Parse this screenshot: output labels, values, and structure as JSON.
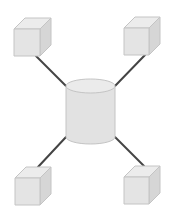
{
  "diagram": {
    "colors": {
      "background": "#ffffff",
      "line": "#444444",
      "shape_fill": "#e4e4e4",
      "shape_top": "#ececec",
      "shape_side": "#d6d6d6",
      "shape_stroke": "#c4c4c4"
    },
    "center": {
      "type": "cylinder",
      "label": "database"
    },
    "nodes": [
      {
        "id": "top-left",
        "type": "cube",
        "label": "node"
      },
      {
        "id": "top-right",
        "type": "cube",
        "label": "node"
      },
      {
        "id": "bottom-left",
        "type": "cube",
        "label": "node"
      },
      {
        "id": "bottom-right",
        "type": "cube",
        "label": "node"
      }
    ],
    "edges": [
      {
        "from": "database",
        "to": "top-left"
      },
      {
        "from": "database",
        "to": "top-right"
      },
      {
        "from": "database",
        "to": "bottom-left"
      },
      {
        "from": "database",
        "to": "bottom-right"
      }
    ]
  }
}
